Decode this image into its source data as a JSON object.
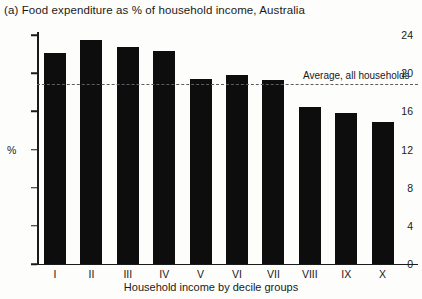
{
  "chart_data": {
    "type": "bar",
    "title": "(a)  Food expenditure as % of household income, Australia",
    "xlabel": "Household income by decile groups",
    "ylabel": "%",
    "categories": [
      "I",
      "II",
      "III",
      "IV",
      "V",
      "VI",
      "VII",
      "VIII",
      "IX",
      "X"
    ],
    "values": [
      22.1,
      23.5,
      22.7,
      22.3,
      19.4,
      19.8,
      19.3,
      16.5,
      15.8,
      14.9
    ],
    "ylim": [
      0,
      25.5
    ],
    "yticks": [
      0,
      4,
      8,
      12,
      16,
      20,
      24
    ],
    "grid": false,
    "legend": false,
    "annotations": [
      {
        "name": "average-line",
        "label": "Average, all households",
        "value": 18.9,
        "style": "dashed-horizontal-line"
      }
    ]
  }
}
